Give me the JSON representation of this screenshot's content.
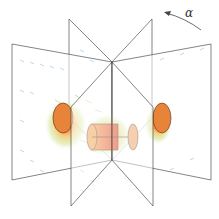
{
  "figure": {
    "type": "3D vector field diagram with rotating planes",
    "rotation_label": "α",
    "colors": {
      "plane_edge": "#333333",
      "vector_low": "#7fb8d8",
      "vector_mid": "#9acd32",
      "vector_high": "#e04020",
      "body_fill": "#e8843a",
      "body_edge": "#5a2a10"
    }
  }
}
